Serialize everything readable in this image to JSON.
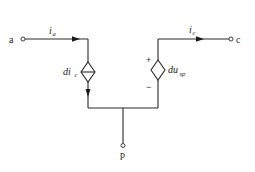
{
  "diagram": {
    "type": "equivalent circuit",
    "nodes": {
      "a": {
        "label": "a"
      },
      "c": {
        "label": "c"
      },
      "p": {
        "label": "p"
      }
    },
    "currents": {
      "ia": {
        "symbol": "i",
        "subscript": "a"
      },
      "ic": {
        "symbol": "i",
        "subscript": "c"
      }
    },
    "sources": {
      "current_source": {
        "kind": "dependent current source",
        "coef": "d",
        "var": "i",
        "subscript": "c"
      },
      "voltage_source": {
        "kind": "dependent voltage source",
        "coef": "d",
        "var": "u",
        "subscript": "sp",
        "plus": "+",
        "minus": "−"
      }
    },
    "colors": {
      "line": "#2a2a2a",
      "background": "#ffffff"
    }
  }
}
